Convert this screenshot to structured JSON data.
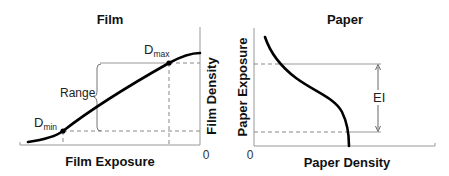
{
  "film_panel": {
    "title": "Film",
    "x_axis_label": "Film Exposure",
    "y_axis_label": "Film Density",
    "origin_label": "0",
    "dmin_label": {
      "main": "D",
      "sub": "min"
    },
    "dmax_label": {
      "main": "D",
      "sub": "max"
    },
    "range_label": "Range"
  },
  "paper_panel": {
    "title": "Paper",
    "x_axis_label": "Paper Density",
    "y_axis_label": "Paper Exposure",
    "origin_label": "0",
    "ei_label": "EI"
  },
  "colors": {
    "curve": "#000000",
    "axis": "#888888",
    "guide": "#777777",
    "text": "#111111"
  }
}
